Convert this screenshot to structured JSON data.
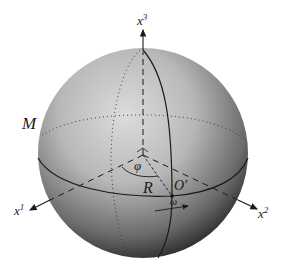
{
  "diagram": {
    "type": "sphere-coordinate-diagram",
    "manifold_label": "M",
    "axes": [
      {
        "name": "x3",
        "base": "x",
        "sup": "3"
      },
      {
        "name": "x1",
        "base": "x",
        "sup": "1"
      },
      {
        "name": "x2",
        "base": "x",
        "sup": "2"
      }
    ],
    "angle_label": "φ",
    "radius_label": "R",
    "point_label": "O′",
    "angular_velocity_label": "ω",
    "colors": {
      "sphere_light": "#d8d8d8",
      "sphere_dark": "#2a2a2a",
      "line": "#1a1a1a"
    }
  }
}
